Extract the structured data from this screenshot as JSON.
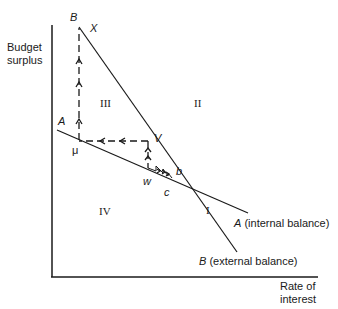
{
  "diagram": {
    "axes": {
      "y_label_line1": "Budget",
      "y_label_line2": "surplus",
      "x_label_line1": "Rate of",
      "x_label_line2": "interest"
    },
    "lines": {
      "A": {
        "letter": "A",
        "caption": "(internal balance)"
      },
      "B": {
        "letter": "B",
        "caption": "(external balance)"
      }
    },
    "points": {
      "B_top": "B",
      "X": "X",
      "A_left": "A",
      "mu": "μ",
      "V": "V",
      "w": "w",
      "b": "b",
      "c": "c"
    },
    "regions": {
      "I": "I",
      "II": "II",
      "III": "III",
      "IV": "IV"
    },
    "colors": {
      "ink": "#1a1a1a",
      "background": "#ffffff"
    }
  }
}
